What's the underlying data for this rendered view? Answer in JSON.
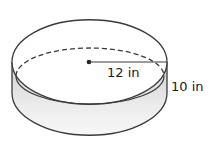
{
  "diagram": {
    "shape": "cylinder",
    "radius_label": "12 in",
    "height_label": "10 in",
    "colors": {
      "stroke": "#3a3a3a",
      "side_fill": "#d9d9d9",
      "side_fill_light": "#f4f4f4",
      "center_dot": "#222222"
    }
  }
}
